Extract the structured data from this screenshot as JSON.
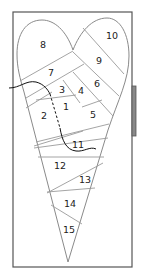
{
  "diagram": {
    "type": "foundation-paper-piecing-pattern",
    "shape": "heart",
    "colors": {
      "frame": "#555555",
      "tab": "#777777",
      "seam": "#9a9a9a",
      "thread": "#111111"
    },
    "pieces": [
      {
        "id": "8",
        "label": "8",
        "x": 43,
        "y": 45
      },
      {
        "id": "10",
        "label": "10",
        "x": 112,
        "y": 36
      },
      {
        "id": "9",
        "label": "9",
        "x": 99,
        "y": 61
      },
      {
        "id": "7",
        "label": "7",
        "x": 51,
        "y": 73
      },
      {
        "id": "6",
        "label": "6",
        "x": 97,
        "y": 84
      },
      {
        "id": "3",
        "label": "3",
        "x": 62,
        "y": 90
      },
      {
        "id": "4",
        "label": "4",
        "x": 81,
        "y": 91
      },
      {
        "id": "1",
        "label": "1",
        "x": 66,
        "y": 107
      },
      {
        "id": "2",
        "label": "2",
        "x": 44,
        "y": 116
      },
      {
        "id": "5",
        "label": "5",
        "x": 93,
        "y": 115
      },
      {
        "id": "11",
        "label": "11",
        "x": 78,
        "y": 145
      },
      {
        "id": "12",
        "label": "12",
        "x": 60,
        "y": 166
      },
      {
        "id": "13",
        "label": "13",
        "x": 85,
        "y": 180
      },
      {
        "id": "14",
        "label": "14",
        "x": 70,
        "y": 204
      },
      {
        "id": "15",
        "label": "15",
        "x": 69,
        "y": 230
      }
    ]
  }
}
